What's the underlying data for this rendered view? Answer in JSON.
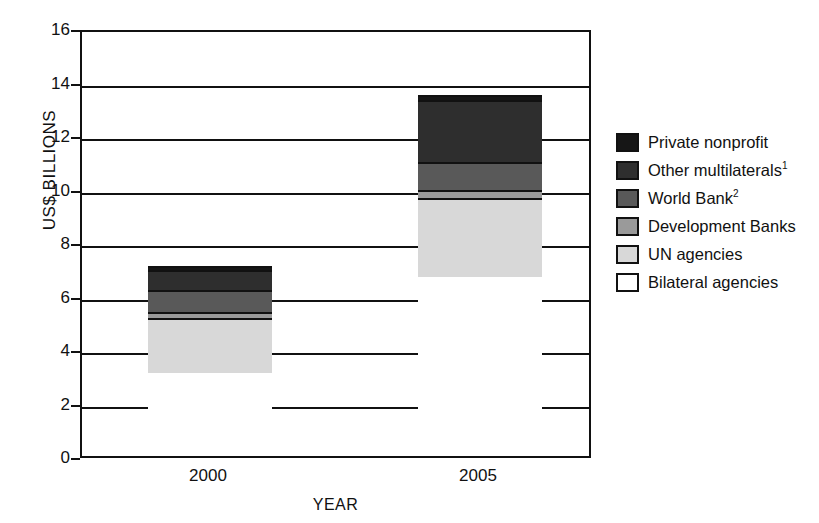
{
  "chart_data": {
    "type": "bar",
    "subtype": "stacked-vertical",
    "title": "",
    "xlabel": "YEAR",
    "ylabel": "US$ BILLIONS",
    "categories": [
      "2000",
      "2005"
    ],
    "ylim": [
      0,
      16
    ],
    "yticks": [
      0,
      2,
      4,
      6,
      8,
      10,
      12,
      14,
      16
    ],
    "ytick_labels": [
      "0",
      "2",
      "4",
      "6",
      "8",
      "10",
      "12",
      "14",
      "16"
    ],
    "grid": true,
    "grid_axis": "y",
    "legend_position": "right",
    "stack_order_bottom_to_top": [
      "Bilateral agencies",
      "UN agencies",
      "Development Banks",
      "World Bank",
      "Other multilaterals",
      "Private nonprofit"
    ],
    "series": [
      {
        "name": "Private nonprofit",
        "legend_label": "Private nonprofit",
        "superscript": "",
        "color": "#161616",
        "values": [
          0.15,
          0.2
        ]
      },
      {
        "name": "Other multilaterals",
        "legend_label": "Other multilaterals",
        "superscript": "1",
        "color": "#2e2e2e",
        "values": [
          0.75,
          2.3
        ]
      },
      {
        "name": "World Bank",
        "legend_label": "World Bank",
        "superscript": "2",
        "color": "#595959",
        "values": [
          0.8,
          1.05
        ]
      },
      {
        "name": "Development Banks",
        "legend_label": "Development Banks",
        "superscript": "",
        "color": "#9a9a9a",
        "values": [
          0.25,
          0.3
        ]
      },
      {
        "name": "UN agencies",
        "legend_label": "UN agencies",
        "superscript": "",
        "color": "#d8d8d8",
        "values": [
          2.05,
          2.95
        ]
      },
      {
        "name": "Bilateral agencies",
        "legend_label": "Bilateral agencies",
        "superscript": "",
        "color": "#ffffff",
        "values": [
          3.1,
          6.7
        ]
      }
    ],
    "totals": [
      7.1,
      13.5
    ],
    "cumulative_tops": {
      "2000": {
        "Bilateral agencies": 3.1,
        "UN agencies": 5.15,
        "Development Banks": 5.4,
        "World Bank": 6.2,
        "Other multilaterals": 6.95,
        "Private nonprofit": 7.1
      },
      "2005": {
        "Bilateral agencies": 6.7,
        "UN agencies": 9.65,
        "Development Banks": 9.95,
        "World Bank": 11.0,
        "Other multilaterals": 13.3,
        "Private nonprofit": 13.5
      }
    }
  }
}
